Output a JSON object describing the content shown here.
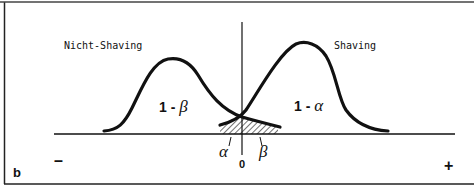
{
  "diagram": {
    "panel_label": "b",
    "left_distribution": {
      "label": "Nicht-Shaving",
      "area_prefix": "1 - ",
      "area_symbol": "β"
    },
    "right_distribution": {
      "label": "Shaving",
      "area_prefix": "1 - ",
      "area_symbol": "α"
    },
    "overlap": {
      "alpha_label": "α",
      "beta_label": "β"
    },
    "axis": {
      "origin_label": "0",
      "minus_label": "–",
      "plus_label": "+"
    },
    "colors": {
      "line": "#111111",
      "background": "#ffffff",
      "border": "#333333"
    }
  }
}
